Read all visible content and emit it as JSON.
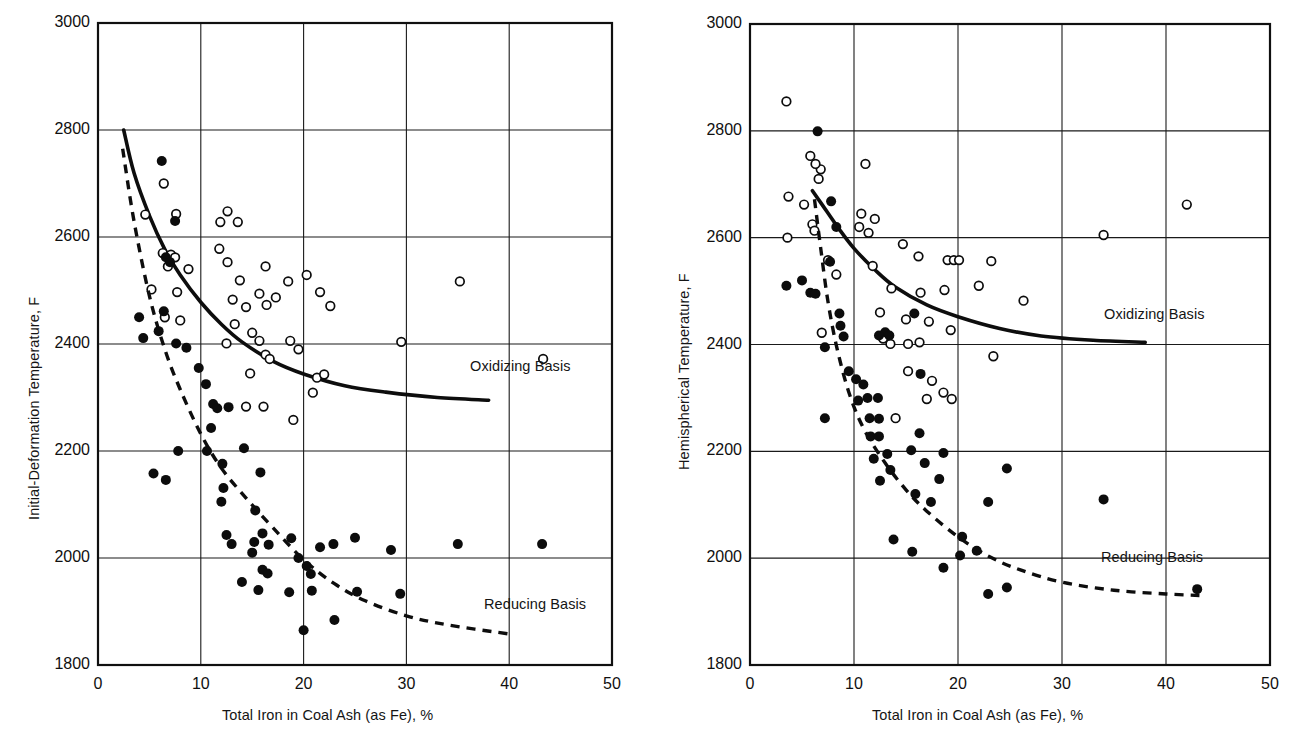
{
  "figure": {
    "background_color": "#ffffff",
    "ink_color": "#0c0c0c",
    "panel_count": 2
  },
  "chart_data": [
    {
      "id": "left",
      "type": "scatter",
      "title": "",
      "xlabel": "Total Iron in Coal Ash (as Fe), %",
      "ylabel": "Initial-Deformation Temperature, F",
      "xlim": [
        0,
        50
      ],
      "ylim": [
        1800,
        3000
      ],
      "xticks": [
        0,
        10,
        20,
        30,
        40,
        50
      ],
      "xticklabels": [
        "0",
        "10",
        "20",
        "30",
        "40",
        "50"
      ],
      "yticks": [
        1800,
        2000,
        2200,
        2400,
        2600,
        2800,
        3000
      ],
      "yticklabels": [
        "1800",
        "2000",
        "2200",
        "2400",
        "2600",
        "2800",
        "3000"
      ],
      "grid": true,
      "legend_position": "inline-annotation",
      "series": [
        {
          "name": "Oxidizing Basis",
          "marker": "open-circle",
          "annotation": "Oxidizing Basis",
          "fit_curve_style": "solid",
          "fit_curve_points": [
            [
              2.5,
              2800
            ],
            [
              3.5,
              2720
            ],
            [
              5,
              2640
            ],
            [
              6.5,
              2577
            ],
            [
              8,
              2529
            ],
            [
              10,
              2478
            ],
            [
              12,
              2437
            ],
            [
              14,
              2404
            ],
            [
              17,
              2368
            ],
            [
              20,
              2344
            ],
            [
              24,
              2322
            ],
            [
              28,
              2310
            ],
            [
              33,
              2300
            ],
            [
              38,
              2295
            ]
          ],
          "points": [
            [
              6.4,
              2700
            ],
            [
              4.6,
              2642
            ],
            [
              7.6,
              2643
            ],
            [
              6.3,
              2570
            ],
            [
              7.1,
              2567
            ],
            [
              7.5,
              2562
            ],
            [
              6.8,
              2545
            ],
            [
              8.8,
              2540
            ],
            [
              5.2,
              2502
            ],
            [
              7.7,
              2497
            ],
            [
              6.5,
              2450
            ],
            [
              8.0,
              2444
            ],
            [
              12.6,
              2648
            ],
            [
              11.9,
              2628
            ],
            [
              13.6,
              2628
            ],
            [
              11.8,
              2578
            ],
            [
              12.6,
              2553
            ],
            [
              13.8,
              2519
            ],
            [
              16.3,
              2545
            ],
            [
              13.1,
              2483
            ],
            [
              14.4,
              2469
            ],
            [
              15.7,
              2494
            ],
            [
              16.4,
              2473
            ],
            [
              18.5,
              2517
            ],
            [
              17.3,
              2487
            ],
            [
              20.3,
              2529
            ],
            [
              21.6,
              2497
            ],
            [
              22.6,
              2471
            ],
            [
              29.5,
              2404
            ],
            [
              35.2,
              2517
            ],
            [
              43.3,
              2372
            ],
            [
              12.5,
              2401
            ],
            [
              13.3,
              2437
            ],
            [
              15.0,
              2421
            ],
            [
              15.7,
              2406
            ],
            [
              16.3,
              2380
            ],
            [
              16.7,
              2372
            ],
            [
              14.8,
              2345
            ],
            [
              18.7,
              2406
            ],
            [
              19.5,
              2390
            ],
            [
              21.3,
              2337
            ],
            [
              22.0,
              2343
            ],
            [
              20.9,
              2309
            ],
            [
              16.1,
              2283
            ],
            [
              14.4,
              2283
            ],
            [
              19.0,
              2258
            ]
          ]
        },
        {
          "name": "Reducing Basis",
          "marker": "filled-circle",
          "annotation": "Reducing Basis",
          "fit_curve_style": "dashed",
          "fit_curve_points": [
            [
              2.4,
              2765
            ],
            [
              3.5,
              2630
            ],
            [
              5,
              2490
            ],
            [
              6.5,
              2390
            ],
            [
              8,
              2315
            ],
            [
              10,
              2232
            ],
            [
              12,
              2168
            ],
            [
              14.5,
              2110
            ],
            [
              17,
              2057
            ],
            [
              20,
              1997
            ],
            [
              23,
              1952
            ],
            [
              26,
              1920
            ],
            [
              30,
              1892
            ],
            [
              34,
              1875
            ],
            [
              40,
              1858
            ]
          ],
          "points": [
            [
              6.2,
              2742
            ],
            [
              7.5,
              2630
            ],
            [
              6.6,
              2562
            ],
            [
              7.0,
              2553
            ],
            [
              4.0,
              2450
            ],
            [
              6.4,
              2461
            ],
            [
              4.4,
              2411
            ],
            [
              5.9,
              2424
            ],
            [
              7.6,
              2401
            ],
            [
              8.6,
              2393
            ],
            [
              9.8,
              2355
            ],
            [
              10.5,
              2325
            ],
            [
              11.2,
              2288
            ],
            [
              11.6,
              2280
            ],
            [
              12.7,
              2282
            ],
            [
              11.0,
              2243
            ],
            [
              12.1,
              2176
            ],
            [
              10.6,
              2200
            ],
            [
              7.8,
              2200
            ],
            [
              5.4,
              2158
            ],
            [
              6.6,
              2146
            ],
            [
              12.2,
              2131
            ],
            [
              15.8,
              2160
            ],
            [
              14.2,
              2205
            ],
            [
              12.0,
              2105
            ],
            [
              15.3,
              2089
            ],
            [
              12.5,
              2043
            ],
            [
              16.0,
              2046
            ],
            [
              13.0,
              2026
            ],
            [
              15.2,
              2030
            ],
            [
              16.6,
              2025
            ],
            [
              15.0,
              2010
            ],
            [
              18.8,
              2037
            ],
            [
              21.6,
              2020
            ],
            [
              22.9,
              2026
            ],
            [
              25.0,
              2038
            ],
            [
              28.5,
              2015
            ],
            [
              35.0,
              2026
            ],
            [
              43.2,
              2026
            ],
            [
              16.0,
              1978
            ],
            [
              16.5,
              1971
            ],
            [
              19.5,
              2000
            ],
            [
              20.3,
              1985
            ],
            [
              20.7,
              1970
            ],
            [
              14.0,
              1955
            ],
            [
              15.6,
              1940
            ],
            [
              18.6,
              1936
            ],
            [
              20.8,
              1939
            ],
            [
              25.2,
              1937
            ],
            [
              29.4,
              1933
            ],
            [
              23.0,
              1884
            ],
            [
              20.0,
              1865
            ]
          ]
        }
      ]
    },
    {
      "id": "right",
      "type": "scatter",
      "title": "",
      "xlabel": "Total Iron in Coal Ash (as Fe), %",
      "ylabel": "Hemispherical Temperature, F",
      "xlim": [
        0,
        50
      ],
      "ylim": [
        1800,
        3000
      ],
      "xticks": [
        0,
        10,
        20,
        30,
        40,
        50
      ],
      "xticklabels": [
        "0",
        "10",
        "20",
        "30",
        "40",
        "50"
      ],
      "yticks": [
        1800,
        2000,
        2200,
        2400,
        2600,
        2800,
        3000
      ],
      "yticklabels": [
        "1800",
        "2000",
        "2200",
        "2400",
        "2600",
        "2800",
        "3000"
      ],
      "grid": true,
      "legend_position": "inline-annotation",
      "series": [
        {
          "name": "Oxidizing Basis",
          "marker": "open-circle",
          "annotation": "Oxidizing Basis",
          "fit_curve_style": "solid",
          "fit_curve_points": [
            [
              6.0,
              2688
            ],
            [
              7.0,
              2660
            ],
            [
              8.5,
              2618
            ],
            [
              10,
              2580
            ],
            [
              12,
              2540
            ],
            [
              14,
              2507
            ],
            [
              17,
              2474
            ],
            [
              20,
              2452
            ],
            [
              24,
              2430
            ],
            [
              28,
              2416
            ],
            [
              33,
              2408
            ],
            [
              38,
              2404
            ]
          ],
          "points": [
            [
              3.5,
              2855
            ],
            [
              5.8,
              2753
            ],
            [
              6.8,
              2728
            ],
            [
              6.6,
              2710
            ],
            [
              6.3,
              2738
            ],
            [
              3.7,
              2677
            ],
            [
              5.2,
              2662
            ],
            [
              6.0,
              2625
            ],
            [
              6.2,
              2613
            ],
            [
              3.6,
              2600
            ],
            [
              7.5,
              2558
            ],
            [
              8.3,
              2531
            ],
            [
              6.9,
              2422
            ],
            [
              11.1,
              2738
            ],
            [
              10.7,
              2645
            ],
            [
              12.0,
              2635
            ],
            [
              10.5,
              2620
            ],
            [
              11.4,
              2609
            ],
            [
              11.8,
              2547
            ],
            [
              14.7,
              2588
            ],
            [
              16.2,
              2565
            ],
            [
              13.6,
              2505
            ],
            [
              16.4,
              2497
            ],
            [
              19.0,
              2558
            ],
            [
              19.6,
              2558
            ],
            [
              20.1,
              2558
            ],
            [
              18.7,
              2502
            ],
            [
              23.2,
              2556
            ],
            [
              22.0,
              2510
            ],
            [
              26.3,
              2482
            ],
            [
              34.0,
              2605
            ],
            [
              42.0,
              2662
            ],
            [
              12.5,
              2460
            ],
            [
              15.0,
              2447
            ],
            [
              17.2,
              2443
            ],
            [
              19.3,
              2427
            ],
            [
              13.5,
              2401
            ],
            [
              15.2,
              2401
            ],
            [
              16.3,
              2404
            ],
            [
              23.4,
              2378
            ],
            [
              15.2,
              2350
            ],
            [
              17.5,
              2332
            ],
            [
              18.6,
              2310
            ],
            [
              17.0,
              2298
            ],
            [
              19.4,
              2298
            ],
            [
              14.0,
              2262
            ],
            [
              12.8,
              2411
            ]
          ]
        },
        {
          "name": "Reducing Basis",
          "marker": "filled-circle",
          "annotation": "Reducing Basis",
          "fit_curve_style": "dashed",
          "fit_curve_points": [
            [
              6.2,
              2672
            ],
            [
              6.8,
              2580
            ],
            [
              7.5,
              2480
            ],
            [
              8.4,
              2390
            ],
            [
              9.6,
              2305
            ],
            [
              11,
              2240
            ],
            [
              13,
              2178
            ],
            [
              15,
              2128
            ],
            [
              17,
              2088
            ],
            [
              20,
              2040
            ],
            [
              23,
              2003
            ],
            [
              26,
              1978
            ],
            [
              30,
              1955
            ],
            [
              35,
              1940
            ],
            [
              40,
              1933
            ],
            [
              43.5,
              1930
            ]
          ],
          "points": [
            [
              6.5,
              2799
            ],
            [
              7.8,
              2668
            ],
            [
              3.5,
              2510
            ],
            [
              5.0,
              2520
            ],
            [
              5.8,
              2497
            ],
            [
              6.3,
              2495
            ],
            [
              8.3,
              2620
            ],
            [
              7.7,
              2555
            ],
            [
              8.6,
              2458
            ],
            [
              8.7,
              2435
            ],
            [
              9.0,
              2415
            ],
            [
              7.2,
              2395
            ],
            [
              9.5,
              2350
            ],
            [
              10.2,
              2335
            ],
            [
              10.9,
              2325
            ],
            [
              11.3,
              2300
            ],
            [
              10.4,
              2295
            ],
            [
              12.3,
              2300
            ],
            [
              11.5,
              2262
            ],
            [
              12.4,
              2261
            ],
            [
              7.2,
              2262
            ],
            [
              11.6,
              2228
            ],
            [
              12.4,
              2228
            ],
            [
              16.3,
              2234
            ],
            [
              13.2,
              2195
            ],
            [
              11.9,
              2186
            ],
            [
              15.5,
              2202
            ],
            [
              18.6,
              2197
            ],
            [
              16.8,
              2178
            ],
            [
              13.5,
              2165
            ],
            [
              12.5,
              2145
            ],
            [
              18.2,
              2148
            ],
            [
              15.9,
              2120
            ],
            [
              17.4,
              2105
            ],
            [
              24.7,
              2168
            ],
            [
              22.9,
              2105
            ],
            [
              34.0,
              2110
            ],
            [
              13.8,
              2035
            ],
            [
              15.6,
              2012
            ],
            [
              20.4,
              2040
            ],
            [
              20.2,
              2005
            ],
            [
              21.8,
              2014
            ],
            [
              18.6,
              1982
            ],
            [
              24.7,
              1945
            ],
            [
              22.9,
              1933
            ],
            [
              43.0,
              1942
            ],
            [
              13.0,
              2423
            ],
            [
              15.8,
              2458
            ],
            [
              16.4,
              2345
            ],
            [
              12.4,
              2417
            ],
            [
              13.4,
              2417
            ]
          ]
        }
      ]
    }
  ]
}
